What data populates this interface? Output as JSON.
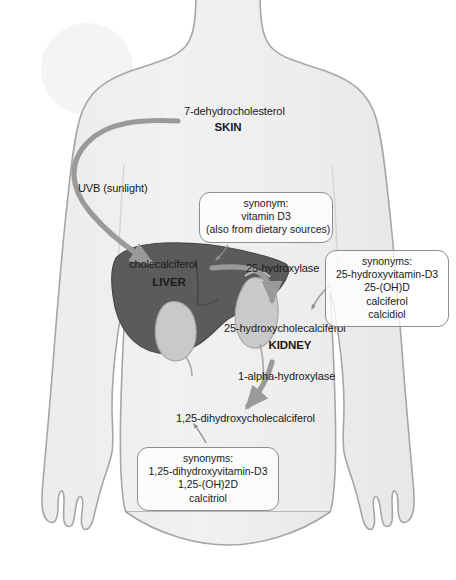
{
  "diagram": {
    "colors": {
      "background": "#ffffff",
      "body_fill": "#efefef",
      "body_outline": "#a6a6a6",
      "sun_fill": "#f4f4f4",
      "liver_fill": "#5b5b5b",
      "liver_outline": "#4a4a4a",
      "kidney_fill": "#c9c9c9",
      "kidney_outline": "#a8a8a8",
      "arrow_thick": "#9a9a9a",
      "arrow_thin": "#9a9a9a",
      "text": "#1a1a1a",
      "callout_border": "#8e8e8e"
    },
    "figure": {
      "sun": "sun-circle",
      "body": "human-torso-silhouette"
    },
    "organs": [
      {
        "id": "liver",
        "label": "LIVER",
        "substance": "cholecalciferol"
      },
      {
        "id": "kidney",
        "label": "KIDNEY",
        "substance": "25-hydroxycholecalciferol"
      }
    ],
    "labels": {
      "precursor": "7-dehydrocholesterol",
      "skin": "SKIN",
      "uvb": "UVB (sunlight)",
      "cholecalciferol": "cholecalciferol",
      "liver": "LIVER",
      "enzyme_25_hydroxylase": "25-hydroxylase",
      "hydroxycholecalciferol": "25-hydroxycholecalciferol",
      "kidney": "KIDNEY",
      "enzyme_1_alpha_hydroxylase": "1-alpha-hydroxylase",
      "dihydroxycholecalciferol": "1,25-dihydroxycholecalciferol"
    },
    "callouts": [
      {
        "id": "vitamin-d3-callout",
        "lines": [
          "synonym:",
          "vitamin D3",
          "(also from dietary sources)"
        ]
      },
      {
        "id": "calcidiol-callout",
        "lines": [
          "synonyms:",
          "25-hydroxyvitamin-D3",
          "25-(OH)D",
          "calciferol",
          "calcidiol"
        ]
      },
      {
        "id": "calcitriol-callout",
        "lines": [
          "synonyms:",
          "1,25-dihydroxyvitamin-D3",
          "1,25-(OH)2D",
          "calcitriol"
        ]
      }
    ],
    "pathway": [
      {
        "from": "7-dehydrocholesterol",
        "to": "cholecalciferol",
        "via": "UVB (sunlight)",
        "site": "SKIN"
      },
      {
        "from": "cholecalciferol",
        "to": "25-hydroxycholecalciferol",
        "via": "25-hydroxylase",
        "site": "LIVER"
      },
      {
        "from": "25-hydroxycholecalciferol",
        "to": "1,25-dihydroxycholecalciferol",
        "via": "1-alpha-hydroxylase",
        "site": "KIDNEY"
      }
    ]
  }
}
